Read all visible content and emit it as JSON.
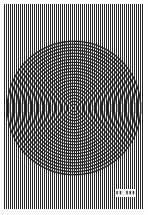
{
  "document": {
    "title": "Moire Interference Test Pattern",
    "width": 148,
    "height": 215,
    "paper_color": "#fefefe",
    "ink_color": "#1a1a1a",
    "margins": {
      "left": 4,
      "right": 4,
      "top": 4,
      "bottom": 6
    }
  },
  "background_grating": {
    "name": "vertical-line-grating",
    "orientation": "vertical",
    "period_px": 2,
    "line_width_px": 1,
    "line_color": "#2b2b2b",
    "gap_color": "#fefefe",
    "coverage": "full-page-inside-margins"
  },
  "ring_pattern": {
    "name": "concentric-ring-zone-plate",
    "shape": "circle",
    "center_x": 74,
    "center_y": 108,
    "radius_px": 68,
    "ring_period_px": 3,
    "ring_line_width_px": 1.4,
    "ring_color": "#202020",
    "rings_count": 23,
    "blend_mode": "multiply",
    "effect": "moire",
    "smear_band_axis": "horizontal"
  },
  "corner_label": {
    "name": "specimen-label",
    "text": "▮▮ ▮▮▮",
    "x": 115,
    "y": 189,
    "width": 21,
    "height": 8,
    "font_size_px": 5,
    "background": "#f2f2f2",
    "border_color": "#ffffff",
    "text_color": "#3a3a3a"
  }
}
